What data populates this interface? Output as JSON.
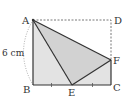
{
  "diagram": {
    "type": "geometry-folded-rectangle",
    "points": {
      "A": {
        "label": "A",
        "x": 33,
        "y": 20
      },
      "B": {
        "label": "B",
        "x": 33,
        "y": 85
      },
      "C": {
        "label": "C",
        "x": 111,
        "y": 85
      },
      "D": {
        "label": "D",
        "x": 111,
        "y": 20
      },
      "E": {
        "label": "E",
        "x": 72,
        "y": 85
      },
      "F": {
        "label": "F",
        "x": 111,
        "y": 60
      }
    },
    "measurement": {
      "label": "6 cm",
      "side": "AB"
    },
    "equal_marks": [
      "BE",
      "EC"
    ],
    "colors": {
      "fill": "#d9d9d9",
      "fill_light": "#e6e6e6",
      "stroke": "#333333",
      "dashed": "#555555"
    }
  }
}
